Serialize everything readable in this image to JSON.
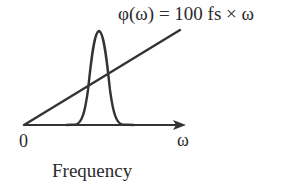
{
  "diagram": {
    "formula_label": "φ(ω) = 100 fs × ω",
    "origin_label": "0",
    "axis_variable_label": "ω",
    "axis_title": "Frequency",
    "colors": {
      "stroke": "#333333",
      "background": "#ffffff"
    },
    "elements": [
      {
        "kind": "axis",
        "direction": "horizontal",
        "arrow": true,
        "label": "ω"
      },
      {
        "kind": "line",
        "description": "linear phase φ(ω) starting at origin"
      },
      {
        "kind": "curve",
        "description": "Gaussian spectrum pulse"
      }
    ]
  }
}
